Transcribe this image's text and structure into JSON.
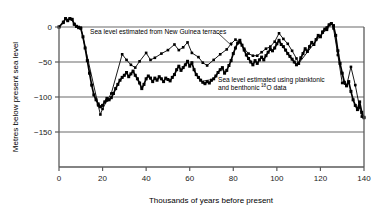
{
  "chart_data": {
    "type": "line",
    "title": "",
    "xlabel": "Thousands of years before present",
    "ylabel": "Metres below present sea level",
    "xlim": [
      0,
      140
    ],
    "ylim": [
      -200,
      25
    ],
    "grid": "horizontal",
    "legend_position": "inline-annotations",
    "xticks": [
      0,
      20,
      40,
      60,
      80,
      100,
      120,
      140
    ],
    "yticks": [
      0,
      -50,
      -100,
      -150
    ],
    "xtick_labels": [
      "0",
      "20",
      "40",
      "60",
      "80",
      "100",
      "120",
      "140"
    ],
    "ytick_labels": [
      "0",
      "−50",
      "−100",
      "−150"
    ],
    "annotations": [
      {
        "name": "new-guinea-terraces-label",
        "text": "Sea level estimated from New Guinea terraces",
        "x": 20,
        "y": -12
      },
      {
        "name": "isotope-data-label-line1",
        "text": "Sea level estimated using planktonic",
        "x": 68,
        "y": -70
      },
      {
        "name": "isotope-data-label-line2",
        "text": "and benthonic",
        "superscript": "18",
        "text_after": "O data",
        "x": 68,
        "y": -77
      }
    ],
    "series": [
      {
        "name": "Sea level estimated from New Guinea terraces",
        "style": "thin-line-with-square-markers",
        "color": "#000000",
        "points": [
          [
            0,
            0
          ],
          [
            2,
            6
          ],
          [
            3,
            12
          ],
          [
            4,
            10
          ],
          [
            5,
            12
          ],
          [
            6,
            11
          ],
          [
            7,
            4
          ],
          [
            8,
            1
          ],
          [
            9,
            0
          ],
          [
            10,
            -1
          ],
          [
            18,
            -112
          ],
          [
            19,
            -125
          ],
          [
            20,
            -117
          ],
          [
            22,
            -105
          ],
          [
            24,
            -95
          ],
          [
            29,
            -39
          ],
          [
            31,
            -47
          ],
          [
            33,
            -54
          ],
          [
            35,
            -58
          ],
          [
            37,
            -49
          ],
          [
            40,
            -37
          ],
          [
            42,
            -47
          ],
          [
            44,
            -44
          ],
          [
            47,
            -38
          ],
          [
            50,
            -33
          ],
          [
            53,
            -25
          ],
          [
            55,
            -33
          ],
          [
            57,
            -29
          ],
          [
            59,
            -22
          ],
          [
            61,
            -37
          ],
          [
            64,
            -43
          ],
          [
            66,
            -51
          ],
          [
            68,
            -55
          ],
          [
            71,
            -47
          ],
          [
            74,
            -39
          ],
          [
            77,
            -32
          ],
          [
            79,
            -24
          ],
          [
            81,
            -18
          ],
          [
            83,
            -22
          ],
          [
            85,
            -31
          ],
          [
            87,
            -38
          ],
          [
            89,
            -41
          ],
          [
            91,
            -41
          ],
          [
            93,
            -36
          ],
          [
            95,
            -31
          ],
          [
            97,
            -28
          ],
          [
            99,
            -21
          ],
          [
            101,
            -9
          ],
          [
            103,
            -17
          ],
          [
            105,
            -24
          ],
          [
            107,
            -34
          ],
          [
            109,
            -45
          ],
          [
            110,
            -52
          ],
          [
            121,
            -8
          ],
          [
            123,
            -4
          ],
          [
            124,
            3
          ],
          [
            125,
            5
          ],
          [
            126,
            -2
          ],
          [
            128,
            -40
          ],
          [
            130,
            -80
          ],
          [
            132,
            -84
          ],
          [
            134,
            -57
          ],
          [
            136,
            -83
          ],
          [
            138,
            -115
          ],
          [
            139,
            -128
          ],
          [
            140,
            -130
          ]
        ]
      },
      {
        "name": "Sea level estimated using planktonic and benthonic 18O data",
        "style": "thick-line-with-square-markers",
        "color": "#000000",
        "points": [
          [
            0,
            0
          ],
          [
            2,
            7
          ],
          [
            3,
            12
          ],
          [
            4,
            9
          ],
          [
            5,
            12
          ],
          [
            6,
            11
          ],
          [
            7,
            4
          ],
          [
            8,
            1
          ],
          [
            9,
            -1
          ],
          [
            10,
            -2
          ],
          [
            11,
            -14
          ],
          [
            12,
            -30
          ],
          [
            13,
            -48
          ],
          [
            14,
            -66
          ],
          [
            15,
            -83
          ],
          [
            16,
            -97
          ],
          [
            17,
            -104
          ],
          [
            18,
            -110
          ],
          [
            19,
            -114
          ],
          [
            20,
            -112
          ],
          [
            21,
            -107
          ],
          [
            22,
            -102
          ],
          [
            23,
            -104
          ],
          [
            24,
            -101
          ],
          [
            25,
            -95
          ],
          [
            26,
            -88
          ],
          [
            27,
            -82
          ],
          [
            28,
            -76
          ],
          [
            29,
            -72
          ],
          [
            30,
            -69
          ],
          [
            31,
            -65
          ],
          [
            32,
            -71
          ],
          [
            33,
            -67
          ],
          [
            34,
            -63
          ],
          [
            35,
            -69
          ],
          [
            36,
            -74
          ],
          [
            37,
            -80
          ],
          [
            38,
            -88
          ],
          [
            39,
            -82
          ],
          [
            40,
            -74
          ],
          [
            41,
            -70
          ],
          [
            42,
            -73
          ],
          [
            43,
            -78
          ],
          [
            44,
            -73
          ],
          [
            45,
            -76
          ],
          [
            46,
            -71
          ],
          [
            47,
            -74
          ],
          [
            48,
            -78
          ],
          [
            49,
            -73
          ],
          [
            50,
            -75
          ],
          [
            51,
            -77
          ],
          [
            52,
            -72
          ],
          [
            53,
            -68
          ],
          [
            54,
            -61
          ],
          [
            55,
            -56
          ],
          [
            56,
            -62
          ],
          [
            57,
            -58
          ],
          [
            58,
            -54
          ],
          [
            59,
            -49
          ],
          [
            60,
            -56
          ],
          [
            61,
            -51
          ],
          [
            62,
            -61
          ],
          [
            63,
            -68
          ],
          [
            64,
            -72
          ],
          [
            65,
            -76
          ],
          [
            66,
            -79
          ],
          [
            67,
            -81
          ],
          [
            68,
            -78
          ],
          [
            69,
            -80
          ],
          [
            70,
            -76
          ],
          [
            71,
            -74
          ],
          [
            72,
            -70
          ],
          [
            73,
            -65
          ],
          [
            74,
            -61
          ],
          [
            75,
            -58
          ],
          [
            76,
            -66
          ],
          [
            77,
            -62
          ],
          [
            78,
            -55
          ],
          [
            79,
            -48
          ],
          [
            80,
            -38
          ],
          [
            81,
            -30
          ],
          [
            82,
            -23
          ],
          [
            83,
            -19
          ],
          [
            84,
            -26
          ],
          [
            85,
            -33
          ],
          [
            86,
            -40
          ],
          [
            87,
            -45
          ],
          [
            88,
            -50
          ],
          [
            89,
            -54
          ],
          [
            90,
            -48
          ],
          [
            91,
            -52
          ],
          [
            92,
            -47
          ],
          [
            93,
            -43
          ],
          [
            94,
            -47
          ],
          [
            95,
            -41
          ],
          [
            96,
            -36
          ],
          [
            97,
            -32
          ],
          [
            98,
            -34
          ],
          [
            99,
            -30
          ],
          [
            100,
            -24
          ],
          [
            101,
            -19
          ],
          [
            102,
            -25
          ],
          [
            103,
            -28
          ],
          [
            104,
            -33
          ],
          [
            105,
            -38
          ],
          [
            106,
            -42
          ],
          [
            107,
            -46
          ],
          [
            108,
            -50
          ],
          [
            109,
            -54
          ],
          [
            110,
            -52
          ],
          [
            111,
            -44
          ],
          [
            112,
            -38
          ],
          [
            113,
            -31
          ],
          [
            114,
            -35
          ],
          [
            115,
            -28
          ],
          [
            116,
            -22
          ],
          [
            117,
            -25
          ],
          [
            118,
            -18
          ],
          [
            119,
            -12
          ],
          [
            120,
            -14
          ],
          [
            121,
            -7
          ],
          [
            122,
            -3
          ],
          [
            123,
            -1
          ],
          [
            124,
            3
          ],
          [
            125,
            5
          ],
          [
            126,
            2
          ],
          [
            127,
            -12
          ],
          [
            128,
            -34
          ],
          [
            129,
            -52
          ],
          [
            130,
            -66
          ],
          [
            131,
            -79
          ],
          [
            132,
            -84
          ],
          [
            133,
            -78
          ],
          [
            134,
            -92
          ],
          [
            135,
            -104
          ],
          [
            136,
            -112
          ],
          [
            137,
            -118
          ],
          [
            138,
            -107
          ],
          [
            139,
            -122
          ],
          [
            140,
            -129
          ]
        ]
      }
    ]
  },
  "figure": {
    "background_color": "#ffffff",
    "axis_color": "#5a5a5a",
    "series_color": "#000000"
  }
}
